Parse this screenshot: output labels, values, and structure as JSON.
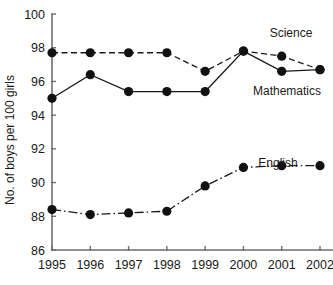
{
  "chart_data": {
    "type": "line",
    "title": "",
    "xlabel": "",
    "ylabel": "No. of boys per 100 girls",
    "categories": [
      "1995",
      "1996",
      "1997",
      "1998",
      "1999",
      "2000",
      "2001",
      "2002"
    ],
    "x": [
      1995,
      1996,
      1997,
      1998,
      1999,
      2000,
      2001,
      2002
    ],
    "xlim": [
      1995,
      2002
    ],
    "ylim": [
      86,
      100
    ],
    "yticks": [
      86,
      88,
      90,
      92,
      94,
      96,
      98,
      100
    ],
    "ytick_labels": [
      "86",
      "88",
      "90",
      "92",
      "94",
      "96",
      "98",
      "100"
    ],
    "grid": false,
    "legend_position": "inline-right",
    "series": [
      {
        "name": "Science",
        "line_style": "dashed",
        "marker": "filled-circle",
        "color": "#111111",
        "values": [
          97.7,
          97.7,
          97.7,
          97.7,
          96.6,
          97.8,
          97.5,
          96.7
        ]
      },
      {
        "name": "Mathematics",
        "line_style": "solid",
        "marker": "filled-circle",
        "color": "#111111",
        "values": [
          95.0,
          96.4,
          95.4,
          95.4,
          95.4,
          97.8,
          96.6,
          96.7
        ]
      },
      {
        "name": "English",
        "line_style": "dash-dot",
        "marker": "filled-circle",
        "color": "#111111",
        "values": [
          88.4,
          88.1,
          88.2,
          88.3,
          89.8,
          90.9,
          91.0,
          91.0
        ]
      }
    ],
    "annotations": [
      {
        "text": "Science",
        "series": "Science",
        "x": 291,
        "y": 37
      },
      {
        "text": "Mathematics",
        "series": "Mathematics",
        "x": 321,
        "y": 95
      },
      {
        "text": "English",
        "series": "English",
        "x": 278,
        "y": 167
      }
    ]
  }
}
